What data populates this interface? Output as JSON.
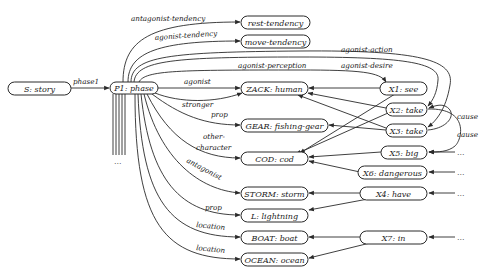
{
  "diagram": {
    "nodes": {
      "story": "S: story",
      "phase": "P1: phase",
      "rest_tendency": "rest-tendency",
      "move_tendency": "move-tendency",
      "zack": "ZACK: human",
      "gear": "GEAR: fishing-gear",
      "cod": "COD: cod",
      "storm": "STORM: storm",
      "lightning": "L: lightning",
      "boat": "BOAT: boat",
      "ocean": "OCEAN: ocean",
      "x1": "X1: see",
      "x2": "X2: take",
      "x3": "X3: take",
      "x5": "X5: big",
      "x6": "X6: dangerous",
      "x4": "X4: have",
      "x7": "X7: in"
    },
    "edge_labels": {
      "phase1": "phase1",
      "antagonist_tendency": "antagonist-tendency",
      "agonist_tendency": "agonist-tendency",
      "agonist_action": "agonist-action",
      "agonist_perception": "agonist-perception",
      "agonist_desire": "agonist-desire",
      "agonist": "agonist",
      "stronger": "stronger",
      "prop_gear": "prop",
      "other_character_1": "other-",
      "other_character_2": "character",
      "antagonist": "antagonist",
      "prop_lightning": "prop",
      "location_boat": "location",
      "location_ocean": "location",
      "cause_1": "cause",
      "cause_2": "cause"
    },
    "ellipsis": "..."
  }
}
